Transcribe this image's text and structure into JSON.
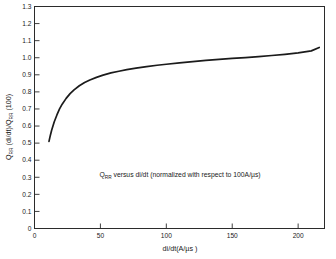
{
  "figure": {
    "background_color": "#ffffff",
    "axis_color": "#2b2b2b",
    "curve_color": "#1b1b1b"
  },
  "chart_data": {
    "type": "line",
    "title": "",
    "annotation": "Q_RR versus di/dt (normalized with respect to 100A/µs)",
    "annotation_parts": {
      "q": "Q",
      "q_sub": "RR",
      "rest": " versus di/dt (normalized with respect to 100A/µs)"
    },
    "xlabel": "di/dt(A/µs )",
    "ylabel": "Q_RR (di/dt)/Q_RR (100)",
    "ylabel_parts": {
      "q1": "Q",
      "q1_sub": "RR",
      "mid": " (di/dt)/Q",
      "q2_sub": "RR",
      "tail": " (100)"
    },
    "xlim": [
      0,
      220
    ],
    "ylim": [
      0,
      1.3
    ],
    "xticks": [
      0,
      50,
      100,
      150,
      200
    ],
    "xtick_labels": [
      "0",
      "50",
      "100",
      "150",
      "200"
    ],
    "yticks": [
      0,
      0.1,
      0.2,
      0.3,
      0.4,
      0.5,
      0.6,
      0.7,
      0.8,
      0.9,
      1.0,
      1.1,
      1.2,
      1.3
    ],
    "ytick_labels": [
      "0",
      "0.1",
      "0.2",
      "0.3",
      "0.4",
      "0.5",
      "0.6",
      "0.7",
      "0.8",
      "0.9",
      "1.0",
      "1.1",
      "1.2",
      "1.3"
    ],
    "grid": false,
    "legend": null,
    "series": [
      {
        "name": "Qrr(di/dt)/Qrr(100)",
        "x": [
          11,
          12,
          13,
          15,
          17,
          19,
          21,
          24,
          27,
          30,
          34,
          38,
          42,
          47,
          52,
          58,
          64,
          70,
          77,
          85,
          93,
          100,
          110,
          120,
          130,
          140,
          150,
          160,
          170,
          180,
          190,
          200,
          210,
          216
        ],
        "y": [
          0.51,
          0.545,
          0.575,
          0.625,
          0.665,
          0.7,
          0.728,
          0.762,
          0.79,
          0.812,
          0.836,
          0.855,
          0.87,
          0.885,
          0.898,
          0.911,
          0.921,
          0.93,
          0.939,
          0.948,
          0.956,
          0.962,
          0.97,
          0.977,
          0.984,
          0.99,
          0.996,
          1.001,
          1.007,
          1.013,
          1.02,
          1.028,
          1.04,
          1.06
        ]
      }
    ]
  }
}
